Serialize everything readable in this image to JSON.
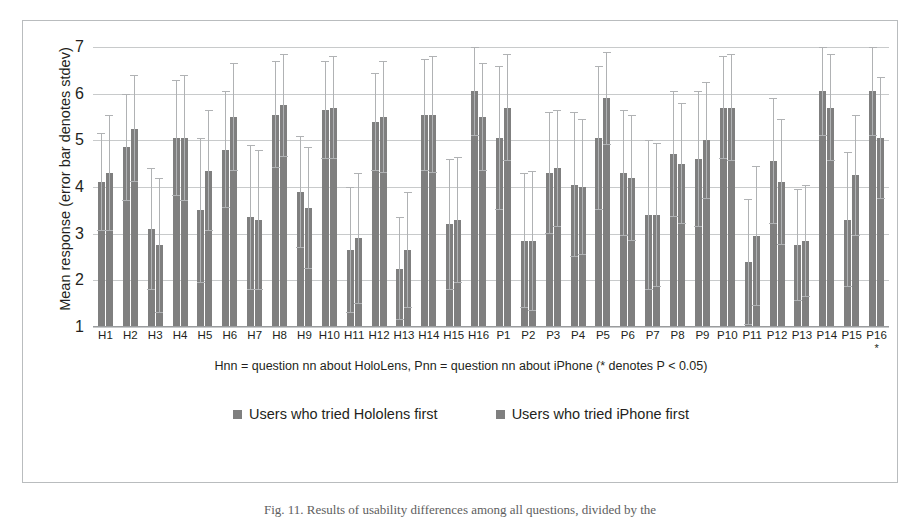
{
  "chart_data": {
    "type": "bar",
    "title": "",
    "xlabel": "Hnn = question nn about HoloLens, Pnn = question nn about iPhone (* denotes P < 0.05)",
    "ylabel": "Mean response (error bar denotes stdev)",
    "ylim": [
      1,
      7
    ],
    "yticks": [
      1,
      2,
      3,
      4,
      5,
      6,
      7
    ],
    "grid": true,
    "legend_position": "bottom",
    "categories": [
      "H1",
      "H2",
      "H3",
      "H4",
      "H5",
      "H6",
      "H7",
      "H8",
      "H9",
      "H10",
      "H11",
      "H12",
      "H13",
      "H14",
      "H15",
      "H16",
      "P1",
      "P2",
      "P3",
      "P4",
      "P5",
      "P6",
      "P7",
      "P8",
      "P9",
      "P10",
      "P11",
      "P12",
      "P13",
      "P14",
      "P15",
      "P16"
    ],
    "significant_categories": [
      "P16"
    ],
    "significance_marker": "*",
    "series": [
      {
        "name": "Users who tried Hololens first",
        "color": "#7f7f7f",
        "values": [
          4.1,
          4.85,
          3.1,
          5.05,
          3.5,
          4.8,
          3.35,
          5.55,
          3.9,
          5.65,
          2.65,
          5.4,
          2.25,
          5.55,
          3.2,
          6.05,
          5.05,
          2.85,
          4.3,
          4.05,
          5.05,
          4.3,
          3.4,
          4.7,
          4.6,
          5.7,
          2.4,
          4.55,
          2.75,
          6.05,
          3.3,
          6.05
        ],
        "stdev": [
          1.05,
          1.15,
          1.3,
          1.25,
          1.55,
          1.25,
          1.55,
          1.15,
          1.2,
          1.05,
          1.35,
          1.05,
          1.1,
          1.2,
          1.4,
          0.95,
          1.55,
          1.45,
          1.3,
          1.55,
          1.55,
          1.35,
          1.6,
          1.35,
          1.45,
          1.1,
          1.35,
          1.35,
          1.2,
          0.95,
          1.45,
          0.95
        ]
      },
      {
        "name": "Users who tried iPhone first",
        "color": "#7f7f7f",
        "values": [
          4.3,
          5.25,
          2.75,
          5.05,
          4.35,
          5.5,
          3.3,
          5.75,
          3.55,
          5.7,
          2.9,
          5.5,
          2.65,
          5.55,
          3.3,
          5.5,
          5.7,
          2.85,
          4.4,
          4.0,
          5.9,
          4.2,
          3.4,
          4.5,
          5.0,
          5.7,
          2.95,
          4.1,
          2.85,
          5.7,
          4.25,
          5.05
        ],
        "stdev": [
          1.25,
          1.15,
          1.45,
          1.35,
          1.3,
          1.15,
          1.5,
          1.1,
          1.3,
          1.1,
          1.4,
          1.2,
          1.25,
          1.25,
          1.35,
          1.15,
          1.15,
          1.5,
          1.25,
          1.45,
          1.0,
          1.35,
          1.55,
          1.3,
          1.25,
          1.15,
          1.5,
          1.35,
          1.2,
          1.15,
          1.3,
          1.3
        ]
      }
    ]
  },
  "axis": {
    "caption": "Hnn = question nn about HoloLens, Pnn = question nn about iPhone (* denotes P < 0.05)",
    "y_title": "Mean response (error bar denotes stdev)"
  },
  "legend": {
    "items": [
      {
        "label": "Users who tried Hololens first"
      },
      {
        "label": "Users who tried iPhone first"
      }
    ]
  },
  "figure": {
    "caption": "Fig. 11. Results of usability differences among all questions, divided by the"
  }
}
